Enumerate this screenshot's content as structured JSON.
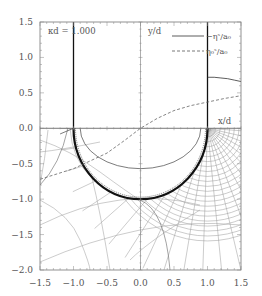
{
  "chart_data": {
    "type": "line",
    "title": "",
    "xlabel": "x/d",
    "ylabel": "y/d",
    "xlim": [
      -1.5,
      1.5
    ],
    "ylim": [
      -2.0,
      1.5
    ],
    "x_ticks": [
      "-1.5",
      "-1.0",
      "-0.5",
      "0.0",
      "0.5",
      "1.0",
      "1.5"
    ],
    "y_ticks": [
      "1.5",
      "1.0",
      "0.5",
      "0.0",
      "-0.5",
      "-1.0",
      "-1.5",
      "-2.0"
    ],
    "annotation": "κd = 1.000",
    "grid": false,
    "legend": {
      "position": "upper right",
      "entries": [
        {
          "label": "−ηˢ/a₀",
          "style": "solid"
        },
        {
          "label": "η₀ˢ/a₀",
          "style": "dashed"
        }
      ]
    },
    "series": [
      {
        "name": "−ηˢ/a₀",
        "style": "solid",
        "x": [
          1.0,
          1.1,
          1.2,
          1.3,
          1.4,
          1.5
        ],
        "y": [
          0.72,
          0.72,
          0.71,
          0.7,
          0.68,
          0.66
        ]
      },
      {
        "name": "η₀ˢ/a₀",
        "style": "dashed",
        "x": [
          -1.5,
          -1.0,
          -0.5,
          -0.25,
          0.0,
          0.25,
          0.5,
          0.75,
          1.0,
          1.25,
          1.5
        ],
        "y": [
          -0.72,
          -0.57,
          -0.35,
          -0.18,
          0.0,
          0.14,
          0.25,
          0.32,
          0.37,
          0.42,
          0.46
        ]
      }
    ],
    "boundary": {
      "description": "Semicircular boundary of radius 1 centered at origin (lower half) with vertical walls at x=±1 for y>0",
      "radius": 1.0,
      "walls_x": [
        -1.0,
        1.0
      ]
    },
    "inner_contour": {
      "description": "Inner arc inside semicircle",
      "center_y": 0.0,
      "rx": 0.9,
      "ry": 0.57
    }
  },
  "labels": {
    "annotation": "κd = 1.000",
    "xlabel": "x/d",
    "ylabel": "y/d",
    "legend_solid": "−ηˢ/a₀",
    "legend_dashed": "η₀ˢ/a₀"
  }
}
